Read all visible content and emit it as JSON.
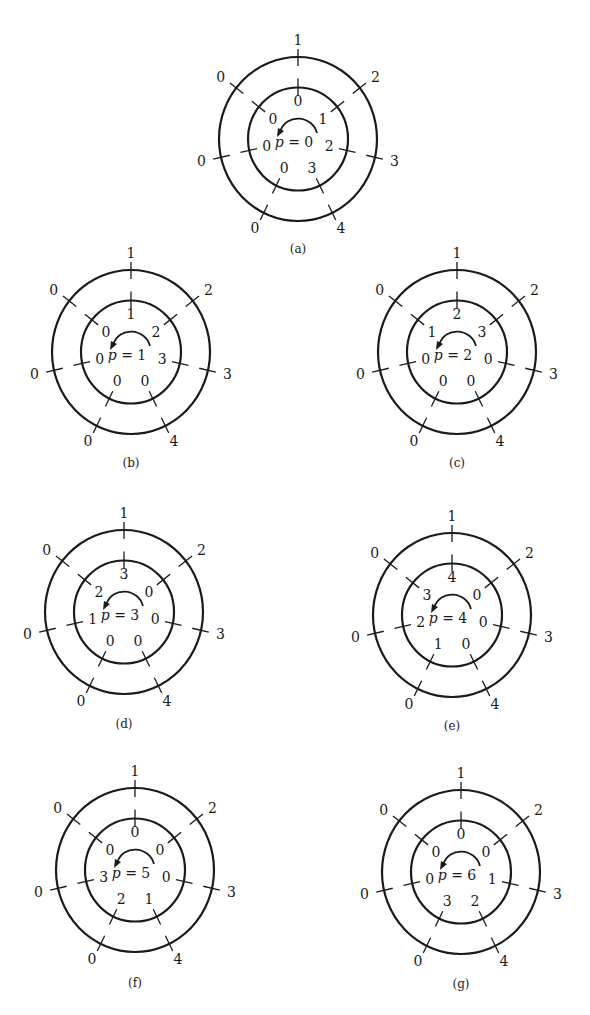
{
  "figure": {
    "sector_count": 7,
    "outer_labels": [
      "1",
      "2",
      "3",
      "4",
      "0",
      "0",
      "0"
    ],
    "colors": {
      "ink": "#1a1a1a",
      "background": "#ffffff"
    },
    "diagrams": [
      {
        "id": "a",
        "caption": "(a)",
        "p_var": "p",
        "p_eq": " = ",
        "p_value": "0",
        "inner_labels": [
          "0",
          "1",
          "2",
          "3",
          "0",
          "0",
          "0"
        ],
        "cx": 298,
        "cy": 139,
        "caption_y": 253
      },
      {
        "id": "b",
        "caption": "(b)",
        "p_var": "p",
        "p_eq": " = ",
        "p_value": "1",
        "inner_labels": [
          "1",
          "2",
          "3",
          "0",
          "0",
          "0",
          "0"
        ],
        "cx": 131,
        "cy": 352,
        "caption_y": 467
      },
      {
        "id": "c",
        "caption": "(c)",
        "p_var": "p",
        "p_eq": " = ",
        "p_value": "2",
        "inner_labels": [
          "2",
          "3",
          "0",
          "0",
          "0",
          "0",
          "1"
        ],
        "cx": 457,
        "cy": 352,
        "caption_y": 467
      },
      {
        "id": "d",
        "caption": "(d)",
        "p_var": "p",
        "p_eq": " = ",
        "p_value": "3",
        "inner_labels": [
          "3",
          "0",
          "0",
          "0",
          "0",
          "1",
          "2"
        ],
        "cx": 124,
        "cy": 612,
        "caption_y": 728
      },
      {
        "id": "e",
        "caption": "(e)",
        "p_var": "p",
        "p_eq": " = ",
        "p_value": "4",
        "inner_labels": [
          "4",
          "0",
          "0",
          "0",
          "1",
          "2",
          "3"
        ],
        "cx": 452,
        "cy": 615,
        "caption_y": 730
      },
      {
        "id": "f",
        "caption": "(f)",
        "p_var": "p",
        "p_eq": " = ",
        "p_value": "5",
        "inner_labels": [
          "0",
          "0",
          "0",
          "1",
          "2",
          "3",
          "0"
        ],
        "cx": 135,
        "cy": 870,
        "caption_y": 987
      },
      {
        "id": "g",
        "caption": "(g)",
        "p_var": "p",
        "p_eq": " = ",
        "p_value": "6",
        "inner_labels": [
          "0",
          "0",
          "1",
          "2",
          "3",
          "0",
          "0"
        ],
        "cx": 461,
        "cy": 872,
        "caption_y": 988
      }
    ]
  }
}
